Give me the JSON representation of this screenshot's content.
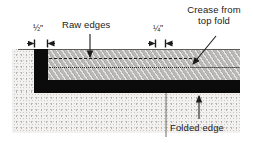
{
  "diagram": {
    "labels": {
      "raw_edges": "Raw edges",
      "crease_line1": "Crease from",
      "crease_line2": "top fold",
      "folded_edge": "Folded edge"
    },
    "dimensions": [
      {
        "id": "half-inch",
        "numerator": "1",
        "denominator": "2",
        "unit": "\"",
        "text": "½\""
      },
      {
        "id": "quarter-inch",
        "numerator": "1",
        "denominator": "4",
        "unit": "\"",
        "text": "¼\""
      }
    ],
    "colors": {
      "fabric_gray": "#b9b8b6",
      "fold_black": "#0b0b0b",
      "surface_stipple": "#f2f1ef",
      "rule_gray": "#5d5c5a",
      "text": "#1b1b1b"
    },
    "elements": {
      "fabric_band": "gray diagonally hatched fabric layer",
      "fold_bar_vertical": "black vertical fold edge at left",
      "fold_bar_horizontal": "black horizontal folded edge",
      "dashed_line": "dashed line marking raw edges",
      "dotted_line": "dotted line marking crease from top fold",
      "surface": "stippled background surface"
    }
  }
}
